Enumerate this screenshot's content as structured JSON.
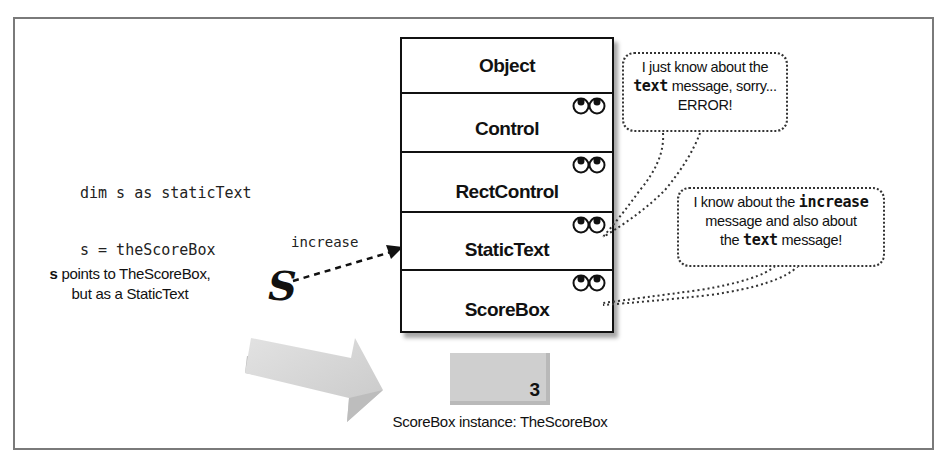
{
  "code": {
    "line1": "dim s as staticText",
    "line2": "s = theScoreBox"
  },
  "arrow": {
    "message_label": "increase",
    "pointer_symbol": "S"
  },
  "pointer_caption": {
    "bold": "s",
    "line1_rest": " points to TheScoreBox,",
    "line2": "but as a StaticText"
  },
  "class_stack": [
    {
      "name": "Object",
      "has_eyes": false
    },
    {
      "name": "Control",
      "has_eyes": true
    },
    {
      "name": "RectControl",
      "has_eyes": true
    },
    {
      "name": "StaticText",
      "has_eyes": true
    },
    {
      "name": "ScoreBox",
      "has_eyes": true
    }
  ],
  "bubble_top": {
    "line1": "I just know about the",
    "line2_code": "text",
    "line2_rest": " message, sorry...",
    "line3": "ERROR!"
  },
  "bubble_bottom": {
    "line1_pre": "I know about the ",
    "line1_code": "increase",
    "line2": "message and also about",
    "line3_pre": "the ",
    "line3_code": "text",
    "line3_rest": " message!"
  },
  "instance": {
    "value": "3",
    "caption": "ScoreBox instance: TheScoreBox"
  },
  "colors": {
    "frame": "#7a7a7a",
    "instance_fill": "#cfcfcf",
    "big_arrow": "#d4d4d4"
  }
}
